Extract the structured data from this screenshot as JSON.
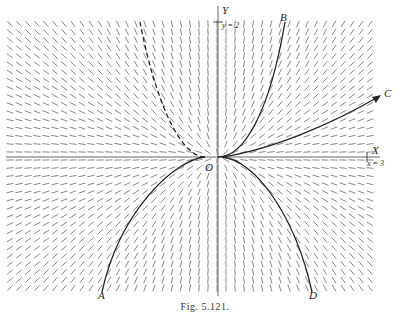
{
  "figure": {
    "caption": "Fig. 5.121.",
    "type": "direction field with integral curves",
    "axes": {
      "x_label": "X",
      "y_label": "Y",
      "origin_label": "O",
      "x_extent_label": "x = 3",
      "y_extent_label": "y = 2"
    },
    "curves": [
      {
        "label": "A",
        "style": "solid",
        "description": "downward parabola, left branch"
      },
      {
        "label": "B",
        "style": "solid",
        "description": "upward parabola, right branch"
      },
      {
        "label": "C",
        "style": "solid-arrow",
        "description": "flat curve rising to the right"
      },
      {
        "label": "D",
        "style": "solid",
        "description": "downward parabola, right branch"
      },
      {
        "label": "",
        "style": "dashed",
        "description": "upward parabola, left branch"
      }
    ],
    "colors": {
      "ink": "#222222",
      "field": "#777777",
      "background": "#ffffff"
    }
  }
}
